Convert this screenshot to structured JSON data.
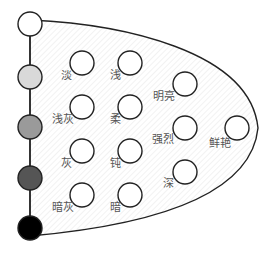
{
  "diagram": {
    "type": "tone-map",
    "shape": "half-ellipse",
    "colors": {
      "outline": "#222222",
      "hatch": "#e4e4e4"
    },
    "neutral_scale": [
      {
        "id": "white",
        "color": "#ffffff"
      },
      {
        "id": "light-gray",
        "color": "#d9d9d9"
      },
      {
        "id": "mid-gray",
        "color": "#9a9a9a"
      },
      {
        "id": "dark-gray",
        "color": "#555555"
      },
      {
        "id": "black",
        "color": "#000000"
      }
    ],
    "tones": [
      {
        "label": "淡"
      },
      {
        "label": "浅"
      },
      {
        "label": "浅灰"
      },
      {
        "label": "柔"
      },
      {
        "label": "灰"
      },
      {
        "label": "钝"
      },
      {
        "label": "暗灰"
      },
      {
        "label": "暗"
      },
      {
        "label": "明亮"
      },
      {
        "label": "强烈"
      },
      {
        "label": "深"
      },
      {
        "label": "鲜艳"
      }
    ]
  }
}
